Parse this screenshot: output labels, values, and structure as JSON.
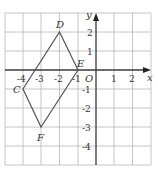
{
  "figure": {
    "type": "coordinate-grid",
    "axes": {
      "x_label": "x",
      "y_label": "y",
      "origin_label": "O"
    },
    "x_ticks": [
      "-4",
      "-3",
      "-2",
      "-1",
      "1",
      "2"
    ],
    "y_ticks": [
      "2",
      "1",
      "-1",
      "-2",
      "-3",
      "-4"
    ],
    "shape": {
      "vertices": [
        {
          "name": "D",
          "x": -2,
          "y": 2
        },
        {
          "name": "E",
          "x": -1,
          "y": 0
        },
        {
          "name": "F",
          "x": -3,
          "y": -3
        },
        {
          "name": "C",
          "x": -4,
          "y": -1
        }
      ]
    },
    "colors": {
      "grid": "#b8b8b8",
      "axis": "#3a3a3a",
      "shape": "#555555"
    }
  }
}
